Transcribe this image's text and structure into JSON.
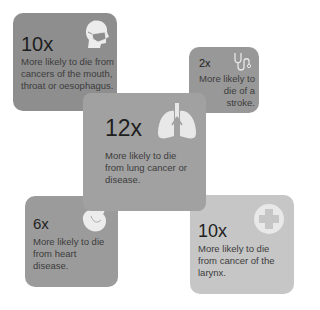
{
  "tiles": [
    {
      "id": "mouth",
      "multiplier": "10x",
      "text": "More likely to die from cancers of the mouth, throat or oesophagus.",
      "icon": "head-mask-icon",
      "color": "#8e8e8e"
    },
    {
      "id": "stroke",
      "multiplier": "2x",
      "text": "More likely to die of a stroke.",
      "icon": "stethoscope-icon",
      "color": "#989898"
    },
    {
      "id": "lung",
      "multiplier": "12x",
      "text": "More likely to die from lung cancer or disease.",
      "icon": "lungs-icon",
      "color": "#a1a1a1"
    },
    {
      "id": "heart",
      "multiplier": "6x",
      "text": "More likely to die from heart disease.",
      "icon": "heart-icon",
      "color": "#9b9b9b"
    },
    {
      "id": "larynx",
      "multiplier": "10x",
      "text": "More likely to die from cancer of the larynx.",
      "icon": "medical-cross-icon",
      "color": "#c6c6c6"
    }
  ]
}
